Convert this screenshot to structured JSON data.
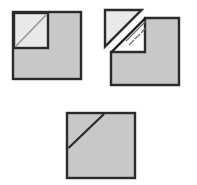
{
  "canvas": {
    "width": 197,
    "height": 185,
    "background": "#ffffff",
    "title": "Paper folding sequence: square with corner flap"
  },
  "palette": {
    "sheet_fill": "#c8c8c8",
    "flap_fill": "#e9e9e9",
    "notch_fill": "#ffffff",
    "outline": "#2b2b2b",
    "crease_line": "#9a9a9a",
    "fold_line": "#1f1f1f",
    "hatch_mark": "#6a6a6a"
  },
  "figures": [
    {
      "id": "figure-folded",
      "label": "Folded square with flap in place",
      "position": "top-left",
      "sheet": {
        "name": "outer-square",
        "x": 13,
        "y": 12,
        "width": 68,
        "height": 67,
        "fill": "#c8c8c8",
        "stroke": "#2b2b2b",
        "stroke_width": 2.4
      },
      "flap": {
        "name": "flap-square",
        "x": 14,
        "y": 13,
        "width": 34,
        "height": 35,
        "fill": "#e9e9e9",
        "stroke": "#2b2b2b",
        "stroke_width": 2.4,
        "crease": {
          "name": "crease-diagonal",
          "x1": 15,
          "y1": 47,
          "x2": 47,
          "y2": 14,
          "stroke": "#9a9a9a",
          "stroke_width": 1.6
        }
      }
    },
    {
      "id": "figure-unfolding",
      "label": "Square with flap lifted open along the diagonal crease",
      "position": "top-right",
      "sheet": {
        "name": "notched-square",
        "fill": "#c8c8c8",
        "stroke": "#2b2b2b",
        "stroke_width": 2.4,
        "outline_points": "111,85 179,85 179,18 145,18 145,52 111,52",
        "x": 111,
        "y": 18,
        "width": 68,
        "height": 67
      },
      "notch": {
        "name": "notch-cutout",
        "x": 111,
        "y": 18,
        "width": 34,
        "height": 34,
        "fill": "#ffffff"
      },
      "fold_line": {
        "name": "fold-hinge-line",
        "x1": 112,
        "y1": 52,
        "x2": 146,
        "y2": 18,
        "stroke": "#1f1f1f",
        "stroke_width": 2.4
      },
      "flap": {
        "name": "lifted-flap-triangle",
        "points": "105,10 141,10 105,46",
        "fill": "#e9e9e9",
        "stroke": "#2b2b2b",
        "stroke_width": 2.4
      },
      "motion_hatches": {
        "name": "fold-motion-hatch-marks",
        "count": 7,
        "stroke": "#6a6a6a",
        "stroke_width": 1.1
      }
    },
    {
      "id": "figure-unfolded",
      "label": "Unfolded square showing the single diagonal crease",
      "position": "bottom-center",
      "sheet": {
        "name": "plain-square",
        "x": 67,
        "y": 113,
        "width": 68,
        "height": 65,
        "fill": "#c8c8c8",
        "stroke": "#2b2b2b",
        "stroke_width": 2.4
      },
      "crease": {
        "name": "crease-diagonal",
        "x1": 69,
        "y1": 148,
        "x2": 104,
        "y2": 114,
        "stroke": "#2b2b2b",
        "stroke_width": 2.2
      }
    }
  ]
}
